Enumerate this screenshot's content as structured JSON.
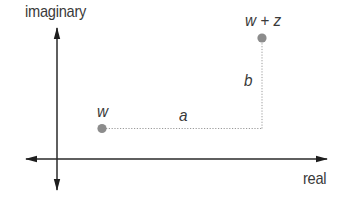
{
  "diagram": {
    "axes": {
      "vertical_label": "imaginary",
      "horizontal_label": "real"
    },
    "points": [
      {
        "id": "w",
        "label": "w",
        "x": 102,
        "y": 128
      },
      {
        "id": "w_plus_z",
        "label": "w + z",
        "x": 262,
        "y": 38
      }
    ],
    "segments": [
      {
        "id": "a",
        "label": "a",
        "from": "w",
        "to": "corner",
        "style": "dotted"
      },
      {
        "id": "b",
        "label": "b",
        "from": "corner",
        "to": "w_plus_z",
        "style": "dotted"
      }
    ],
    "colors": {
      "axis": "#2a2a2a",
      "point": "#8c8c8c",
      "dotted": "#9a9a9a",
      "text": "#3a3a3a"
    }
  }
}
